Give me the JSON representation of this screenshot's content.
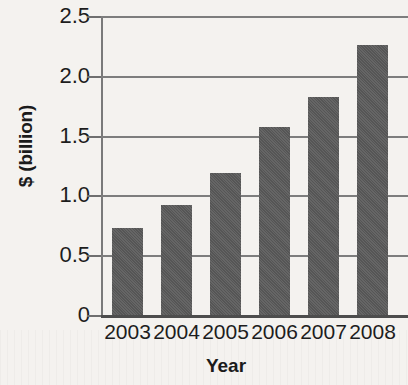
{
  "chart_data": {
    "type": "bar",
    "title": "",
    "xlabel": "Year",
    "ylabel": "$ (billion)",
    "categories": [
      "2003",
      "2004",
      "2005",
      "2006",
      "2007",
      "2008"
    ],
    "values": [
      0.73,
      0.92,
      1.19,
      1.57,
      1.82,
      2.26
    ],
    "series": [
      {
        "name": "",
        "values": [
          0.73,
          0.92,
          1.19,
          1.57,
          1.82,
          2.26
        ]
      }
    ],
    "ylim": [
      0,
      2.5
    ],
    "ytick_labels": [
      "2.5",
      "2.0",
      "1.5",
      "1.0",
      "0.5",
      "0"
    ],
    "ytick_values": [
      2.5,
      2.0,
      1.5,
      1.0,
      0.5,
      0
    ],
    "grid": "horizontal",
    "legend": "none",
    "bar_color": "#5a5a5a",
    "axis_color": "#7a7a7a",
    "text_color": "#1d1d1d",
    "background_color": "#f4f2ef"
  }
}
